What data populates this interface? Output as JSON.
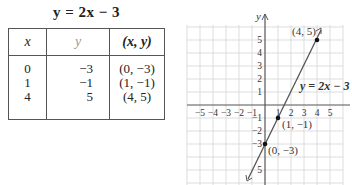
{
  "table": {
    "title": "y = 2x − 3",
    "headers": {
      "x": "x",
      "y": "y",
      "xy": "(x, y)"
    },
    "rows": [
      {
        "x": "0",
        "y": "−3",
        "xy": "(0, −3)"
      },
      {
        "x": "1",
        "y": "−1",
        "xy": "(1, −1)"
      },
      {
        "x": "4",
        "y": "5",
        "xy": "(4, 5)"
      }
    ]
  },
  "graph": {
    "y_axis_label": "y",
    "line_label": "y = 2x − 3",
    "x_ticks": [
      "−5",
      "−4",
      "−3",
      "−2",
      "−1",
      "1",
      "2",
      "3",
      "4",
      "5"
    ],
    "y_ticks": [
      "5",
      "4",
      "3",
      "2",
      "1",
      "−1",
      "−2",
      "−3",
      "5"
    ],
    "points": [
      {
        "label": "(4, 5)",
        "x": 4,
        "y": 5
      },
      {
        "label": "(1, −1)",
        "x": 1,
        "y": -1
      },
      {
        "label": "(0, −3)",
        "x": 0,
        "y": -3
      }
    ],
    "colors": {
      "grid": "#d4d4d4",
      "axis": "#555555",
      "line": "#555555",
      "point": "#111111"
    }
  }
}
